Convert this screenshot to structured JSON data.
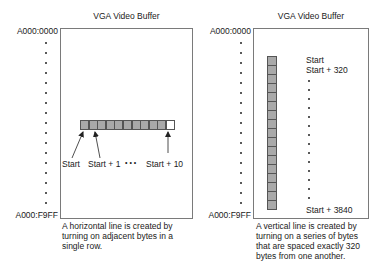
{
  "panels": [
    {
      "title": "VGA Video Buffer",
      "start_address": "A000:0000",
      "end_address": "A000:F9FF",
      "orientation": "horizontal",
      "byte_count": 11,
      "lit_bytes": 10,
      "labels": [
        "Start",
        "Start + 1",
        "Start + 10"
      ],
      "ellipsis": "•  •  •",
      "caption": "A horizontal line is created by turning on adjacent bytes in a single row."
    },
    {
      "title": "VGA Video Buffer",
      "start_address": "A000:0000",
      "end_address": "A000:F9FF",
      "orientation": "vertical",
      "byte_count": 13,
      "labels": [
        "Start",
        "Start + 320",
        "Start + 3840"
      ],
      "caption": "A vertical line is created by turning on a series of bytes that are spaced exactly 320 bytes from one another."
    }
  ],
  "colors": {
    "lit_byte": "#a9a9a9",
    "unlit_byte": "#ffffff",
    "border": "#7a7a7a",
    "text": "#1a1a1a"
  }
}
